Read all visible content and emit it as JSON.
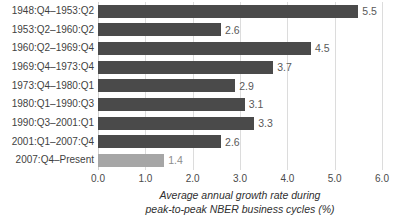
{
  "chart_data": {
    "type": "bar",
    "orientation": "horizontal",
    "title": "",
    "xlabel_line1": "Average  annual growth rate during",
    "xlabel_line2": "peak-to-peak NBER business cycles (%)",
    "ylabel": "",
    "xlim": [
      0.0,
      6.0
    ],
    "xticks": [
      "0.0",
      "1.0",
      "2.0",
      "3.0",
      "4.0",
      "5.0",
      "6.0"
    ],
    "xtick_values": [
      0.0,
      1.0,
      2.0,
      3.0,
      4.0,
      5.0,
      6.0
    ],
    "grid": true,
    "legend": "none",
    "categories": [
      "1948:Q4–1953:Q2",
      "1953:Q2–1960:Q2",
      "1960:Q2–1969:Q4",
      "1969:Q4–1973:Q4",
      "1973:Q4–1980:Q1",
      "1980:Q1–1990:Q3",
      "1990:Q3–2001:Q1",
      "2001:Q1–2007:Q4",
      "2007:Q4–Present"
    ],
    "values": [
      5.5,
      2.6,
      4.5,
      3.7,
      2.9,
      3.1,
      3.3,
      2.6,
      1.4
    ],
    "value_labels": [
      "5.5",
      "2.6",
      "4.5",
      "3.7",
      "2.9",
      "3.1",
      "3.3",
      "2.6",
      "1.4"
    ],
    "bar_colors": [
      "#4a4a4a",
      "#4a4a4a",
      "#4a4a4a",
      "#4a4a4a",
      "#4a4a4a",
      "#4a4a4a",
      "#4a4a4a",
      "#4a4a4a",
      "#a6a6a6"
    ],
    "highlight_index": 8,
    "colors": {
      "bar_dark": "#4a4a4a",
      "bar_light": "#a6a6a6",
      "gridline": "#dcdcdc",
      "text": "#3f3f3f",
      "value_text": "#595959"
    }
  }
}
